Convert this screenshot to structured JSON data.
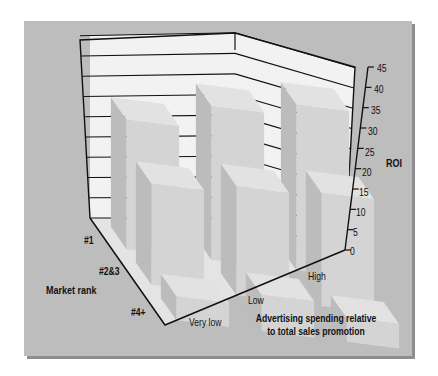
{
  "chart_data": {
    "type": "bar",
    "subtype": "3d-bar-grid",
    "title": "",
    "zlabel": "ROI",
    "xlabel": "Advertising spending relative to total sales promotion",
    "ylabel": "Market rank",
    "x_categories": [
      "Very low",
      "Low",
      "High"
    ],
    "y_categories": [
      "#1",
      "#2&3",
      "#4+"
    ],
    "z_ticks": [
      0,
      5,
      10,
      15,
      20,
      25,
      30,
      35,
      40,
      45
    ],
    "zlim": [
      0,
      45
    ],
    "grid": true,
    "series": [
      {
        "name": "#1",
        "values": [
          32,
          38,
          41
        ]
      },
      {
        "name": "#2&3",
        "values": [
          25,
          27,
          28
        ]
      },
      {
        "name": "#4+",
        "values": [
          6,
          9,
          6
        ]
      }
    ]
  },
  "labels": {
    "roi": "ROI",
    "market_rank": "Market rank",
    "x_title_line1": "Advertising spending relative",
    "x_title_line2": "to total sales promotion",
    "rank_1": "#1",
    "rank_2": "#2&3",
    "rank_3": "#4+",
    "adv_1": "Very low",
    "adv_2": "Low",
    "adv_3": "High",
    "ticks": [
      "0",
      "5",
      "10",
      "15",
      "20",
      "25",
      "30",
      "35",
      "40",
      "45"
    ]
  },
  "colors": {
    "panel": "#bdbdbd",
    "wall": "#f2f2f2",
    "floor": "#e4e4e4",
    "bar_top": "#e2e2e2",
    "bar_front": "#d4d4d4",
    "bar_side": "#bcbcbc",
    "line": "#111111"
  }
}
